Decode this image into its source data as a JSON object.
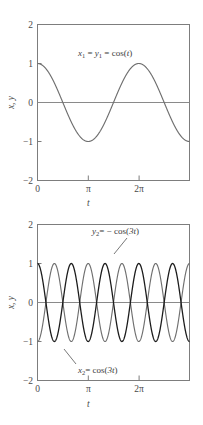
{
  "figure": {
    "background": "#ffffff",
    "panels": [
      "top",
      "bottom"
    ]
  },
  "chart_data": [
    {
      "type": "line",
      "panel": "top",
      "title": "",
      "xlabel": "t",
      "ylabel": "x, y",
      "xlim": [
        0,
        9.4248
      ],
      "ylim": [
        -2,
        2
      ],
      "xticks": [
        0,
        3.14159,
        6.28319
      ],
      "xticklabels": [
        "0",
        "π",
        "2π"
      ],
      "yticks": [
        -2,
        -1,
        0,
        1,
        2
      ],
      "yticklabels": [
        "−2",
        "−1",
        "0",
        "1",
        "2"
      ],
      "grid": false,
      "legend": "none",
      "annotations": [
        {
          "name": "curve-label-x1y1",
          "text_plain": "x1 = y1 = cos(t)",
          "lhs_var": "x",
          "lhs_sub": "1",
          "mid_var": "y",
          "mid_sub": "1",
          "rhs": "cos(",
          "rhs_var": "t",
          "rhs_close": ")",
          "x": 4.2,
          "y": 1.55
        }
      ],
      "series": [
        {
          "name": "x1 = y1 = cos(t)",
          "color": "#6f6f6f",
          "formula": "cos(t)",
          "amplitude": 1,
          "frequency": 1,
          "phase": 0,
          "x": [
            0,
            0.3,
            0.6,
            0.9,
            1.2,
            1.5,
            1.8,
            2.1,
            2.4,
            2.7,
            3.0,
            3.3,
            3.6,
            3.9,
            4.2,
            4.5,
            4.8,
            5.1,
            5.4,
            5.7,
            6.0,
            6.3,
            6.6,
            6.9,
            7.2,
            7.5,
            7.8,
            8.1,
            8.4,
            8.7,
            9.0,
            9.4248
          ],
          "values": [
            1.0,
            0.955,
            0.825,
            0.622,
            0.362,
            0.071,
            -0.227,
            -0.505,
            -0.737,
            -0.904,
            -0.99,
            -0.987,
            -0.897,
            -0.726,
            -0.49,
            -0.211,
            0.087,
            0.378,
            0.635,
            0.835,
            0.96,
            1.0,
            0.95,
            0.815,
            0.608,
            0.347,
            0.055,
            -0.243,
            -0.519,
            -0.748,
            -0.911,
            -1.0
          ]
        }
      ]
    },
    {
      "type": "line",
      "panel": "bottom",
      "title": "",
      "xlabel": "t",
      "ylabel": "x, y",
      "xlim": [
        0,
        9.4248
      ],
      "ylim": [
        -2,
        2
      ],
      "xticks": [
        0,
        3.14159,
        6.28319
      ],
      "xticklabels": [
        "0",
        "π",
        "2π"
      ],
      "yticks": [
        -2,
        -1,
        0,
        1,
        2
      ],
      "yticklabels": [
        "−2",
        "−1",
        "0",
        "1",
        "2"
      ],
      "grid": false,
      "legend": "none",
      "annotations": [
        {
          "name": "curve-label-y2",
          "text_plain": "y2 = − cos(3t)",
          "lhs_var": "y",
          "lhs_sub": "2",
          "rhs": "= − cos(",
          "rhs_var": "3t",
          "rhs_close": ")",
          "x": 5.6,
          "y": 1.62,
          "leader_from": [
            5.35,
            1.3
          ],
          "leader_to": [
            4.6,
            0.55
          ]
        },
        {
          "name": "curve-label-x2",
          "text_plain": "x2 = cos(3t)",
          "lhs_var": "x",
          "lhs_sub": "2",
          "rhs": "= cos(",
          "rhs_var": "3t",
          "rhs_close": ")",
          "x": 3.1,
          "y": -1.62,
          "leader_from": [
            2.85,
            -1.42
          ],
          "leader_to": [
            2.1,
            -0.72
          ]
        }
      ],
      "series": [
        {
          "name": "x2 = cos(3t)",
          "color": "#1c1c1c",
          "formula": "cos(3t)",
          "amplitude": 1,
          "frequency": 3,
          "phase": 0
        },
        {
          "name": "y2 = -cos(3t)",
          "color": "#6f6f6f",
          "formula": "-cos(3t)",
          "amplitude": 1,
          "frequency": 3,
          "phase": 3.14159
        }
      ]
    }
  ]
}
